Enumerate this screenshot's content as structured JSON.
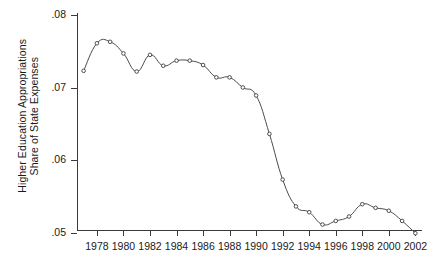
{
  "chart_data": {
    "type": "line",
    "title": "",
    "subtitle": "",
    "xlabel": "",
    "ylabel": "Higher Education Appropriations Share of State Expenses",
    "ylabel_lines": [
      "Higher Education Appropriations",
      "Share of State Expenses"
    ],
    "grid": false,
    "legend": "none",
    "marker": "open-circle",
    "line_color": "#4b4b52",
    "marker_fill": "#ffffff",
    "marker_stroke": "#3c3c42",
    "xlim": [
      1976.5,
      2002.5
    ],
    "ylim": [
      0.05,
      0.08
    ],
    "yticks": [
      0.08,
      0.07,
      0.06,
      0.05
    ],
    "ytick_labels": [
      ".08",
      ".07",
      ".06",
      ".05"
    ],
    "xticks": [
      1978,
      1980,
      1982,
      1984,
      1986,
      1988,
      1990,
      1992,
      1994,
      1996,
      1998,
      2000,
      2002
    ],
    "xtick_labels": [
      "1978",
      "1980",
      "1982",
      "1984",
      "1986",
      "1988",
      "1990",
      "1992",
      "1994",
      "1996",
      "1998",
      "2000",
      "2002"
    ],
    "x": [
      1977,
      1978,
      1979,
      1980,
      1981,
      1982,
      1983,
      1984,
      1985,
      1986,
      1987,
      1988,
      1989,
      1990,
      1991,
      1992,
      1993,
      1994,
      1995,
      1996,
      1997,
      1998,
      1999,
      2000,
      2001,
      2002
    ],
    "values": [
      0.0723,
      0.0761,
      0.0763,
      0.0747,
      0.0722,
      0.0745,
      0.073,
      0.0737,
      0.0737,
      0.0731,
      0.0714,
      0.0714,
      0.07,
      0.0689,
      0.0636,
      0.0573,
      0.0536,
      0.0528,
      0.0511,
      0.0516,
      0.0522,
      0.0539,
      0.0534,
      0.053,
      0.0516,
      0.0499
    ],
    "series": [
      {
        "name": "Higher Education Appropriations Share of State Expenses",
        "values": [
          0.0723,
          0.0761,
          0.0763,
          0.0747,
          0.0722,
          0.0745,
          0.073,
          0.0737,
          0.0737,
          0.0731,
          0.0714,
          0.0714,
          0.07,
          0.0689,
          0.0636,
          0.0573,
          0.0536,
          0.0528,
          0.0511,
          0.0516,
          0.0522,
          0.0539,
          0.0534,
          0.053,
          0.0516,
          0.0499
        ]
      }
    ]
  }
}
